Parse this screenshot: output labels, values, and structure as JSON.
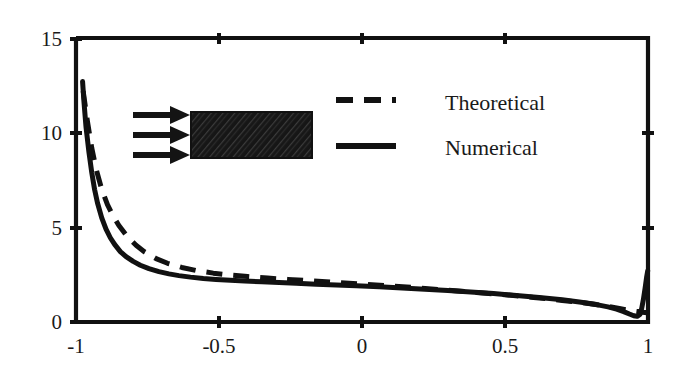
{
  "chart_data": {
    "type": "line",
    "title": "",
    "xlabel": "",
    "ylabel": "",
    "xlim": [
      -1,
      1
    ],
    "ylim": [
      0,
      15
    ],
    "grid": false,
    "xticks": [
      -1,
      -0.5,
      0,
      0.5,
      1
    ],
    "xtick_labels": [
      "-1",
      "-0.5",
      "0",
      "0.5",
      "1"
    ],
    "yticks": [
      0,
      5,
      10,
      15
    ],
    "ytick_labels": [
      "0",
      "5",
      "10",
      "15"
    ],
    "legend_position": "upper right",
    "series": [
      {
        "name": "Theoretical",
        "style": "dashed",
        "color": "#111111",
        "x": [
          -0.975,
          -0.96,
          -0.945,
          -0.93,
          -0.91,
          -0.89,
          -0.87,
          -0.85,
          -0.82,
          -0.79,
          -0.76,
          -0.72,
          -0.68,
          -0.63,
          -0.58,
          -0.52,
          -0.46,
          -0.4,
          -0.33,
          -0.26,
          -0.18,
          -0.1,
          0.0,
          0.1,
          0.2,
          0.3,
          0.4,
          0.5,
          0.6,
          0.7,
          0.78,
          0.85,
          0.9,
          0.94,
          0.965,
          0.98,
          0.99,
          0.997,
          1.0
        ],
        "y": [
          12.2,
          10.6,
          9.2,
          8.1,
          7.0,
          6.2,
          5.6,
          5.1,
          4.5,
          4.05,
          3.7,
          3.35,
          3.1,
          2.88,
          2.72,
          2.58,
          2.48,
          2.4,
          2.32,
          2.25,
          2.18,
          2.1,
          2.0,
          1.9,
          1.8,
          1.68,
          1.56,
          1.44,
          1.3,
          1.14,
          1.0,
          0.85,
          0.72,
          0.6,
          0.55,
          0.52,
          0.5,
          0.48,
          0.45
        ]
      },
      {
        "name": "Numerical",
        "style": "solid",
        "color": "#111111",
        "x": [
          -0.977,
          -0.972,
          -0.965,
          -0.955,
          -0.945,
          -0.935,
          -0.925,
          -0.91,
          -0.895,
          -0.88,
          -0.865,
          -0.845,
          -0.825,
          -0.8,
          -0.775,
          -0.745,
          -0.71,
          -0.675,
          -0.64,
          -0.6,
          -0.555,
          -0.51,
          -0.46,
          -0.41,
          -0.35,
          -0.29,
          -0.23,
          -0.16,
          -0.09,
          -0.02,
          0.06,
          0.14,
          0.22,
          0.3,
          0.38,
          0.46,
          0.54,
          0.62,
          0.7,
          0.76,
          0.82,
          0.86,
          0.89,
          0.915,
          0.935,
          0.95,
          0.962,
          0.972,
          0.978,
          0.984,
          0.99,
          0.995,
          0.999
        ],
        "y": [
          12.7,
          11.6,
          10.3,
          9.0,
          7.9,
          7.0,
          6.3,
          5.5,
          4.9,
          4.45,
          4.1,
          3.72,
          3.45,
          3.2,
          3.0,
          2.82,
          2.66,
          2.54,
          2.45,
          2.37,
          2.3,
          2.25,
          2.2,
          2.16,
          2.12,
          2.08,
          2.05,
          2.0,
          1.96,
          1.92,
          1.86,
          1.8,
          1.73,
          1.66,
          1.58,
          1.5,
          1.4,
          1.3,
          1.18,
          1.06,
          0.92,
          0.8,
          0.68,
          0.55,
          0.42,
          0.33,
          0.3,
          0.4,
          0.72,
          1.2,
          1.8,
          2.35,
          2.7
        ]
      }
    ],
    "annotations": [
      {
        "name": "flow-arrows",
        "type": "arrows",
        "count": 3,
        "direction": "right"
      },
      {
        "name": "hatched-body",
        "type": "rectangle",
        "fill": "hatched-dark"
      }
    ]
  },
  "legend": {
    "entries": [
      {
        "label": "Theoretical",
        "style": "dashed"
      },
      {
        "label": "Numerical",
        "style": "solid"
      }
    ]
  },
  "colors": {
    "line": "#111111",
    "axis": "#111111",
    "background": "#ffffff",
    "hatch": "#1c1c1c"
  }
}
